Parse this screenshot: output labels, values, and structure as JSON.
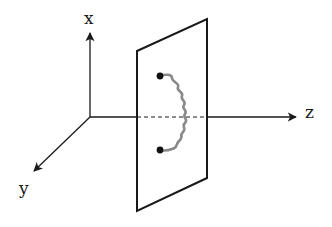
{
  "diagram": {
    "type": "3d-coordinate-system-with-plane",
    "axes": {
      "x": {
        "label": "x",
        "direction": "up"
      },
      "y": {
        "label": "y",
        "direction": "down-left"
      },
      "z": {
        "label": "z",
        "direction": "right"
      }
    },
    "elements": [
      {
        "name": "plane",
        "description": "parallelogram plane perpendicular to z-axis"
      },
      {
        "name": "dot-top",
        "description": "black endpoint on plane"
      },
      {
        "name": "dot-bottom",
        "description": "black endpoint on plane"
      },
      {
        "name": "spring",
        "description": "gray wavy line (spring) connecting the two dots"
      },
      {
        "name": "z-axis-hidden-segment",
        "description": "dashed portion of z-axis behind the plane"
      }
    ],
    "colors": {
      "line": "#1a1a1a",
      "spring": "#8a8a8a",
      "dot": "#111111",
      "background": "#ffffff"
    }
  }
}
